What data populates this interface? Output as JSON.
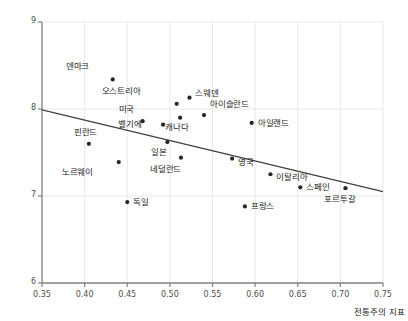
{
  "chart_data": {
    "type": "scatter",
    "title": "",
    "subtitle": "",
    "xlabel": "전통주의 지표",
    "ylabel": "",
    "xlim": [
      0.35,
      0.75
    ],
    "ylim": [
      6,
      9
    ],
    "xticks": [
      "0.35",
      "0.40",
      "0.45",
      "0.50",
      "0.55",
      "0.60",
      "0.65",
      "0.70",
      "0.75"
    ],
    "xtick_values": [
      0.35,
      0.4,
      0.45,
      0.5,
      0.55,
      0.6,
      0.65,
      0.7,
      0.75
    ],
    "yticks": [
      "6",
      "7",
      "8",
      "9"
    ],
    "ytick_values": [
      6,
      7,
      8,
      9
    ],
    "grid": true,
    "legend": "none",
    "point_color": "#262626",
    "line_color": "#3f3f3f",
    "grid_color": "#e8e8e8",
    "axis_color": "#808080",
    "points": [
      {
        "label": "덴마크",
        "x": 0.433,
        "y": 8.34,
        "lx": -38,
        "ly": -14
      },
      {
        "label": "오스트리아",
        "x": 0.508,
        "y": 8.06,
        "lx": -50,
        "ly": -14
      },
      {
        "label": "스웨덴",
        "x": 0.523,
        "y": 8.13,
        "lx": 6,
        "ly": -6
      },
      {
        "label": "아이슬란드",
        "x": 0.54,
        "y": 7.93,
        "lx": 6,
        "ly": -12
      },
      {
        "label": "미국",
        "x": 0.468,
        "y": 7.86,
        "lx": -22,
        "ly": -13
      },
      {
        "label": "벨기에",
        "x": 0.492,
        "y": 7.82,
        "lx": -36,
        "ly": -2
      },
      {
        "label": "캐나다",
        "x": 0.512,
        "y": 7.9,
        "lx": -6,
        "ly": 8
      },
      {
        "label": "아일랜드",
        "x": 0.596,
        "y": 7.84,
        "lx": 6,
        "ly": -1
      },
      {
        "label": "핀란드",
        "x": 0.405,
        "y": 7.6,
        "lx": -6,
        "ly": -13
      },
      {
        "label": "일본",
        "x": 0.497,
        "y": 7.62,
        "lx": -14,
        "ly": 9
      },
      {
        "label": "네덜란드",
        "x": 0.513,
        "y": 7.44,
        "lx": -14,
        "ly": 10
      },
      {
        "label": "노르웨이",
        "x": 0.44,
        "y": 7.39,
        "lx": -40,
        "ly": 9
      },
      {
        "label": "영국",
        "x": 0.573,
        "y": 7.43,
        "lx": 6,
        "ly": 2
      },
      {
        "label": "이탈리아",
        "x": 0.618,
        "y": 7.25,
        "lx": 6,
        "ly": 2
      },
      {
        "label": "스페인",
        "x": 0.653,
        "y": 7.1,
        "lx": 6,
        "ly": -1
      },
      {
        "label": "포르투갈",
        "x": 0.706,
        "y": 7.09,
        "lx": -4,
        "ly": 10
      },
      {
        "label": "독일",
        "x": 0.45,
        "y": 6.93,
        "lx": 6,
        "ly": -1
      },
      {
        "label": "프랑스",
        "x": 0.588,
        "y": 6.88,
        "lx": 6,
        "ly": -1
      }
    ],
    "trend_line": {
      "x0": 0.35,
      "y0": 7.99,
      "x1": 0.75,
      "y1": 7.05
    }
  }
}
